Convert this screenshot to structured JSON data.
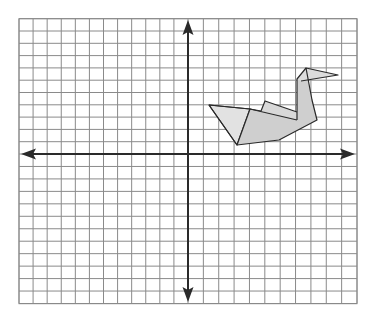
{
  "figure": {
    "grid": {
      "columns_left_of_y_axis": 12,
      "columns_right_of_y_axis": 11,
      "rows_above_x_axis": 11,
      "rows_below_x_axis": 12,
      "line_color": "#8a8a8a",
      "axis_color": "#2a2a2a"
    },
    "shape": {
      "name": "swan",
      "fill_color": "#cfcfcf",
      "light_fill_color": "#e2e2e2",
      "stroke_color": "#2a2a2a",
      "quadrant": "I"
    }
  }
}
